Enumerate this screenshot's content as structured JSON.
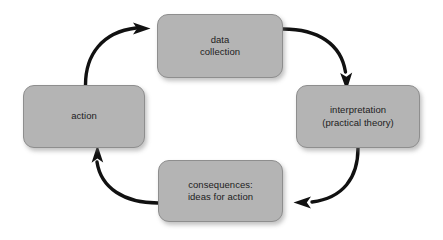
{
  "diagram": {
    "background_color": "#ffffff",
    "node_fill_color": "#b4b4b4",
    "node_border_color": "#8e8e8e",
    "text_color": "#1c1c1c",
    "arrow_color": "#111111",
    "direction": "clockwise",
    "nodes": [
      {
        "id": "data-collection",
        "label": "data\ncollection",
        "line1": "data",
        "line2": "collection",
        "position": "top"
      },
      {
        "id": "interpretation",
        "label": "interpretation\n(practical theory)",
        "line1": "interpretation",
        "line2": "(practical theory)",
        "position": "right"
      },
      {
        "id": "consequences",
        "label": "consequences:\nideas for action",
        "line1": "consequences:",
        "line2": "ideas for action",
        "position": "bottom"
      },
      {
        "id": "action",
        "label": "action",
        "line1": "action",
        "line2": "",
        "position": "left"
      }
    ],
    "arrows": [
      {
        "id": "action-to-data-collection",
        "from": "action",
        "to": "data-collection"
      },
      {
        "id": "data-collection-to-interpretation",
        "from": "data-collection",
        "to": "interpretation"
      },
      {
        "id": "interpretation-to-consequences",
        "from": "interpretation",
        "to": "consequences"
      },
      {
        "id": "consequences-to-action",
        "from": "consequences",
        "to": "action"
      }
    ]
  }
}
